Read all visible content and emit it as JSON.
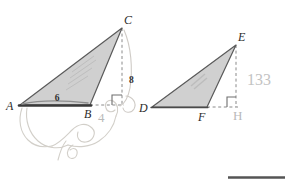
{
  "document": {
    "kind": "scanned-geometry-worksheet",
    "background_color": "#ffffff"
  },
  "figures": [
    {
      "name": "triangle-abc",
      "vertices": {
        "A": "A",
        "B": "B",
        "C": "C"
      },
      "measurements": {
        "base": "6",
        "height": "8"
      },
      "fill_color": "#c9c9c9",
      "stroke_color": "#4a4a4a",
      "has_right_angle_marker": true,
      "has_dashed_altitude": true,
      "has_dashed_baseline_extension": true
    },
    {
      "name": "triangle-def",
      "vertices": {
        "D": "D",
        "E": "E",
        "F": "F"
      },
      "measurements": {
        "base": "",
        "height": ""
      },
      "fill_color": "#c9c9c9",
      "stroke_color": "#4a4a4a",
      "has_right_angle_marker": true,
      "has_dashed_altitude": true,
      "has_dashed_baseline_extension": true
    }
  ],
  "annotations": {
    "pencil_number_right": "133",
    "pencil_mark_below_b": "4",
    "pencil_letter_h": "H"
  },
  "footer": {
    "rule_color": "#555555"
  }
}
